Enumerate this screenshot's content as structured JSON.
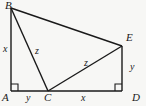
{
  "figure": {
    "background_color": "#f7f7f5",
    "stroke_color": "#1a1a1a",
    "vertices": [
      {
        "id": "B",
        "label": "B",
        "x": 11,
        "y": 8
      },
      {
        "id": "A",
        "label": "A",
        "x": 11,
        "y": 91
      },
      {
        "id": "C",
        "label": "C",
        "x": 48,
        "y": 91
      },
      {
        "id": "D",
        "label": "D",
        "x": 122,
        "y": 91
      },
      {
        "id": "E",
        "label": "E",
        "x": 122,
        "y": 46
      }
    ],
    "segments": [
      {
        "id": "AB",
        "from": "A",
        "to": "B",
        "length_label": "x"
      },
      {
        "id": "AD",
        "from": "A",
        "to": "D",
        "length_label": ""
      },
      {
        "id": "DE",
        "from": "D",
        "to": "E",
        "length_label": "y"
      },
      {
        "id": "BE",
        "from": "B",
        "to": "E",
        "length_label": ""
      },
      {
        "id": "BC",
        "from": "B",
        "to": "C",
        "length_label": "z"
      },
      {
        "id": "CE",
        "from": "C",
        "to": "E",
        "length_label": "z"
      }
    ],
    "side_labels": {
      "ab": "x",
      "ac": "y",
      "cd": "x",
      "de": "y",
      "bc": "z",
      "ce": "z"
    },
    "right_angles": [
      {
        "id": "angle-A",
        "at": "A",
        "marker": "square"
      },
      {
        "id": "angle-D",
        "at": "D",
        "marker": "square"
      }
    ]
  }
}
